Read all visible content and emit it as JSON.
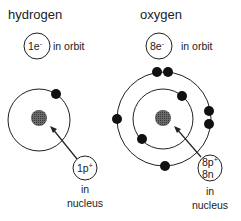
{
  "hydrogen": {
    "title": "hydrogen",
    "orbit_badge": "1e",
    "orbit_badge_sup": "-",
    "orbit_label": "in orbit",
    "nucleus_badge": "1p",
    "nucleus_badge_sup": "+",
    "nucleus_label_1": "in",
    "nucleus_label_2": "nucleus",
    "electron_count": 1
  },
  "oxygen": {
    "title": "oxygen",
    "orbit_badge": "8e",
    "orbit_badge_sup": "-",
    "orbit_label": "in orbit",
    "nucleus_badge_line1": "8p",
    "nucleus_badge_line1_sup": "+",
    "nucleus_badge_line2": "8n",
    "nucleus_label_1": "in",
    "nucleus_label_2": "nucleus",
    "inner_shell_electrons": 2,
    "outer_shell_electrons": 6
  },
  "colors": {
    "line": "#222222",
    "electron": "#111111",
    "nucleus": "#555555"
  }
}
